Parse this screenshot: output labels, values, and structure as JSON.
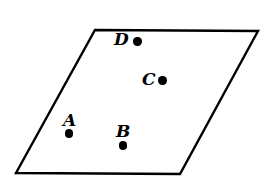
{
  "figure": {
    "width": 273,
    "height": 188,
    "background_color": "#ffffff",
    "stroke_color": "#000000",
    "fill_color": "#ffffff",
    "stroke_width": 2.4
  },
  "shape": {
    "name": "parallelogram",
    "vertices": [
      {
        "name": "top-left",
        "x": 95,
        "y": 30
      },
      {
        "name": "top-right",
        "x": 258,
        "y": 31
      },
      {
        "name": "bottom-right",
        "x": 180,
        "y": 174
      },
      {
        "name": "bottom-left",
        "x": 16,
        "y": 173
      }
    ],
    "points_path": "95,30 258,31 180,174 16,173"
  },
  "points": [
    {
      "id": "A",
      "label": "A",
      "label_x": 63,
      "label_y": 112,
      "dot_x": 69,
      "dot_y": 133.5,
      "dot_r": 4.2,
      "label_position": "above"
    },
    {
      "id": "B",
      "label": "B",
      "label_x": 116,
      "label_y": 123,
      "dot_x": 123,
      "dot_y": 145.5,
      "dot_r": 4.2,
      "label_position": "above"
    },
    {
      "id": "C",
      "label": "C",
      "label_x": 142,
      "label_y": 71,
      "dot_x": 162.5,
      "dot_y": 80.5,
      "dot_r": 4.2,
      "label_position": "left"
    },
    {
      "id": "D",
      "label": "D",
      "label_x": 114,
      "label_y": 31,
      "dot_x": 137.5,
      "dot_y": 41.5,
      "dot_r": 4.2,
      "label_position": "left"
    }
  ]
}
